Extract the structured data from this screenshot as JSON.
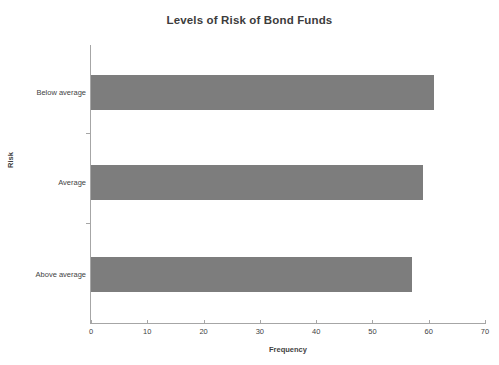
{
  "chart_data": {
    "type": "bar",
    "orientation": "horizontal",
    "title": "Levels of Risk of Bond Funds",
    "xlabel": "Frequency",
    "ylabel": "Risk",
    "categories": [
      "Above average",
      "Average",
      "Below average"
    ],
    "values": [
      57,
      59,
      61
    ],
    "series": [
      {
        "name": "Frequency",
        "values": [
          57,
          59,
          61
        ],
        "color": "#7d7d7d"
      }
    ],
    "xlim": [
      0,
      70
    ],
    "xticks": [
      0,
      10,
      20,
      30,
      40,
      50,
      60,
      70
    ],
    "xtick_labels": [
      "0",
      "10",
      "20",
      "30",
      "40",
      "50",
      "60",
      "70"
    ],
    "grid": false,
    "legend": false,
    "legend_position": "none",
    "background_color": "#ffffff",
    "axis_color": "#a6a6a6",
    "text_color": "#3f3f3f"
  },
  "bars": [
    {
      "category": "Below average",
      "value": 61
    },
    {
      "category": "Average",
      "value": 59
    },
    {
      "category": "Above average",
      "value": 57
    }
  ],
  "xticks": [
    {
      "label": "0",
      "value": 0
    },
    {
      "label": "10",
      "value": 10
    },
    {
      "label": "20",
      "value": 20
    },
    {
      "label": "30",
      "value": 30
    },
    {
      "label": "40",
      "value": 40
    },
    {
      "label": "50",
      "value": 50
    },
    {
      "label": "60",
      "value": 60
    },
    {
      "label": "70",
      "value": 70
    }
  ]
}
